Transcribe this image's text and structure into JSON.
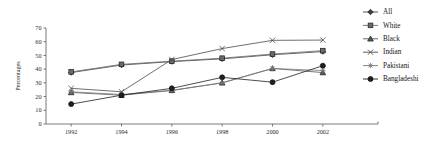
{
  "chart_data": {
    "type": "line",
    "title": "",
    "xlabel": "",
    "ylabel": "Percentages",
    "categories": [
      "1992",
      "1994",
      "1996",
      "1998",
      "2000",
      "2002"
    ],
    "x": [
      1992,
      1994,
      1996,
      1998,
      2000,
      2002
    ],
    "xlim": [
      1991,
      2003
    ],
    "ylim": [
      0,
      70
    ],
    "yticks": [
      0,
      10,
      20,
      30,
      40,
      50,
      60,
      70
    ],
    "ytick_labels": [
      "0",
      "10",
      "20",
      "30",
      "40",
      "50",
      "60",
      "70"
    ],
    "xtick_labels": [
      "1992",
      "1994",
      "1996",
      "1998",
      "2000",
      "2002"
    ],
    "grid": false,
    "legend_position": "right",
    "series": [
      {
        "name": "All",
        "marker": "diamond",
        "color": "#3f3f3f",
        "values": [
          37.5,
          43.0,
          45.5,
          47.5,
          50.5,
          52.8
        ]
      },
      {
        "name": "White",
        "marker": "square",
        "color": "#6b6b6b",
        "values": [
          38.0,
          43.5,
          45.8,
          48.0,
          51.0,
          53.5
        ]
      },
      {
        "name": "Black",
        "marker": "triangle",
        "color": "#575757",
        "values": [
          23.0,
          21.0,
          24.5,
          30.0,
          40.5,
          37.5
        ]
      },
      {
        "name": "Indian",
        "marker": "cross",
        "color": "#4a4a4a",
        "values": [
          26.0,
          23.5,
          47.0,
          55.0,
          61.0,
          61.2
        ]
      },
      {
        "name": "Pakistani",
        "marker": "asterisk",
        "color": "#787878",
        "values": [
          23.5,
          21.5,
          24.5,
          30.0,
          40.5,
          39.0
        ]
      },
      {
        "name": "Bangladeshi",
        "marker": "circle",
        "color": "#1f1f1f",
        "values": [
          14.5,
          21.0,
          26.0,
          34.0,
          30.5,
          42.5
        ]
      }
    ]
  },
  "legend": {
    "items": [
      {
        "label": "All",
        "marker": "diamond"
      },
      {
        "label": "White",
        "marker": "square"
      },
      {
        "label": "Black",
        "marker": "triangle"
      },
      {
        "label": "Indian",
        "marker": "cross"
      },
      {
        "label": "Pakistani",
        "marker": "asterisk"
      },
      {
        "label": "Bangladeshi",
        "marker": "circle"
      }
    ]
  }
}
